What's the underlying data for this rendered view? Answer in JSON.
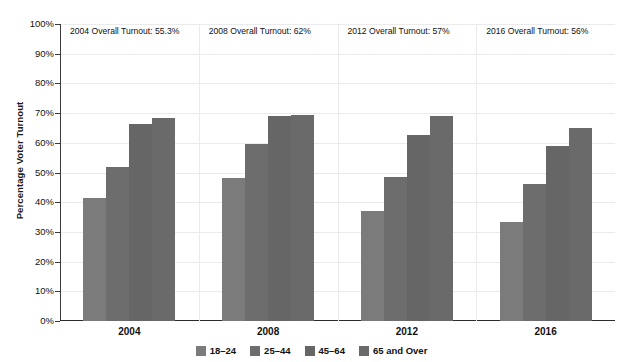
{
  "chart_data": {
    "type": "bar",
    "title": "",
    "xlabel": "",
    "ylabel": "Percentage Voter Turnout",
    "ylim": [
      0,
      100
    ],
    "grid": true,
    "legend_position": "bottom",
    "categories": [
      "2004",
      "2008",
      "2012",
      "2016"
    ],
    "series": [
      {
        "name": "18–24",
        "color": "#7b7b7b",
        "values": [
          41.5,
          48.0,
          37.0,
          33.5
        ]
      },
      {
        "name": "25–44",
        "color": "#6d6d6d",
        "values": [
          52.0,
          59.5,
          48.5,
          46.0
        ]
      },
      {
        "name": "45–64",
        "color": "#666666",
        "values": [
          66.5,
          69.0,
          62.5,
          59.0
        ]
      },
      {
        "name": "65 and Over",
        "color": "#6a6a6a",
        "values": [
          68.5,
          69.5,
          69.0,
          65.0
        ]
      }
    ],
    "ytick_labels": [
      "100%",
      "90%",
      "80%",
      "70%",
      "60%",
      "50%",
      "40%",
      "30%",
      "20%",
      "10%",
      "0%"
    ],
    "ytick_values": [
      100,
      90,
      80,
      70,
      60,
      50,
      40,
      30,
      20,
      10,
      0
    ],
    "annotations": [
      {
        "text": "2004 Overall Turnout: 55.3%",
        "category": "2004",
        "value": 55.3
      },
      {
        "text": "2008 Overall Turnout: 62%",
        "category": "2008",
        "value": 62
      },
      {
        "text": "2012 Overall Turnout: 57%",
        "category": "2012",
        "value": 57
      },
      {
        "text": "2016 Overall Turnout: 56%",
        "category": "2016",
        "value": 56
      }
    ]
  }
}
